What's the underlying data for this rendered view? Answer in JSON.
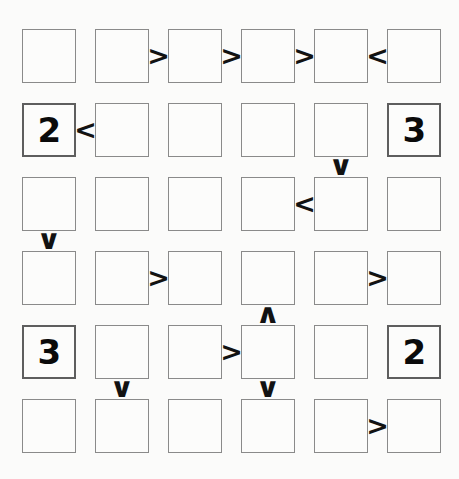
{
  "puzzle": {
    "type": "futoshiki",
    "size": 6,
    "rows": 6,
    "cols": 6,
    "background_color": "#fbfbfa",
    "cell_fill_color": "#fcfcfb",
    "cell_border_color": "#8a8a8a",
    "given_border_color": "#5e5e5e",
    "glyph_color": "#121212"
  },
  "cells": [
    [
      {
        "r": 1,
        "c": 1,
        "value": "",
        "given": false
      },
      {
        "r": 1,
        "c": 2,
        "value": "",
        "given": false
      },
      {
        "r": 1,
        "c": 3,
        "value": "",
        "given": false
      },
      {
        "r": 1,
        "c": 4,
        "value": "",
        "given": false
      },
      {
        "r": 1,
        "c": 5,
        "value": "",
        "given": false
      },
      {
        "r": 1,
        "c": 6,
        "value": "",
        "given": false
      }
    ],
    [
      {
        "r": 2,
        "c": 1,
        "value": "2",
        "given": true
      },
      {
        "r": 2,
        "c": 2,
        "value": "",
        "given": false
      },
      {
        "r": 2,
        "c": 3,
        "value": "",
        "given": false
      },
      {
        "r": 2,
        "c": 4,
        "value": "",
        "given": false
      },
      {
        "r": 2,
        "c": 5,
        "value": "",
        "given": false
      },
      {
        "r": 2,
        "c": 6,
        "value": "3",
        "given": true
      }
    ],
    [
      {
        "r": 3,
        "c": 1,
        "value": "",
        "given": false
      },
      {
        "r": 3,
        "c": 2,
        "value": "",
        "given": false
      },
      {
        "r": 3,
        "c": 3,
        "value": "",
        "given": false
      },
      {
        "r": 3,
        "c": 4,
        "value": "",
        "given": false
      },
      {
        "r": 3,
        "c": 5,
        "value": "",
        "given": false
      },
      {
        "r": 3,
        "c": 6,
        "value": "",
        "given": false
      }
    ],
    [
      {
        "r": 4,
        "c": 1,
        "value": "",
        "given": false
      },
      {
        "r": 4,
        "c": 2,
        "value": "",
        "given": false
      },
      {
        "r": 4,
        "c": 3,
        "value": "",
        "given": false
      },
      {
        "r": 4,
        "c": 4,
        "value": "",
        "given": false
      },
      {
        "r": 4,
        "c": 5,
        "value": "",
        "given": false
      },
      {
        "r": 4,
        "c": 6,
        "value": "",
        "given": false
      }
    ],
    [
      {
        "r": 5,
        "c": 1,
        "value": "3",
        "given": true
      },
      {
        "r": 5,
        "c": 2,
        "value": "",
        "given": false
      },
      {
        "r": 5,
        "c": 3,
        "value": "",
        "given": false
      },
      {
        "r": 5,
        "c": 4,
        "value": "",
        "given": false
      },
      {
        "r": 5,
        "c": 5,
        "value": "",
        "given": false
      },
      {
        "r": 5,
        "c": 6,
        "value": "2",
        "given": true
      }
    ],
    [
      {
        "r": 6,
        "c": 1,
        "value": "",
        "given": false
      },
      {
        "r": 6,
        "c": 2,
        "value": "",
        "given": false
      },
      {
        "r": 6,
        "c": 3,
        "value": "",
        "given": false
      },
      {
        "r": 6,
        "c": 4,
        "value": "",
        "given": false
      },
      {
        "r": 6,
        "c": 5,
        "value": "",
        "given": false
      },
      {
        "r": 6,
        "c": 6,
        "value": "",
        "given": false
      }
    ]
  ],
  "horizontal_constraints": [
    {
      "row": 1,
      "left_col": 2,
      "symbol": ">",
      "name": "greater-than"
    },
    {
      "row": 1,
      "left_col": 3,
      "symbol": ">",
      "name": "greater-than"
    },
    {
      "row": 1,
      "left_col": 4,
      "symbol": ">",
      "name": "greater-than"
    },
    {
      "row": 1,
      "left_col": 5,
      "symbol": "<",
      "name": "less-than"
    },
    {
      "row": 2,
      "left_col": 1,
      "symbol": "<",
      "name": "less-than"
    },
    {
      "row": 3,
      "left_col": 4,
      "symbol": "<",
      "name": "less-than"
    },
    {
      "row": 4,
      "left_col": 2,
      "symbol": ">",
      "name": "greater-than"
    },
    {
      "row": 4,
      "left_col": 5,
      "symbol": ">",
      "name": "greater-than"
    },
    {
      "row": 5,
      "left_col": 3,
      "symbol": ">",
      "name": "greater-than"
    },
    {
      "row": 6,
      "left_col": 5,
      "symbol": ">",
      "name": "greater-than"
    }
  ],
  "vertical_constraints": [
    {
      "col": 5,
      "top_row": 2,
      "symbol": "∨",
      "name": "greater-than-down"
    },
    {
      "col": 1,
      "top_row": 3,
      "symbol": "∨",
      "name": "greater-than-down"
    },
    {
      "col": 4,
      "top_row": 4,
      "symbol": "∧",
      "name": "less-than-up"
    },
    {
      "col": 2,
      "top_row": 5,
      "symbol": "∨",
      "name": "greater-than-down"
    },
    {
      "col": 4,
      "top_row": 5,
      "symbol": "∨",
      "name": "greater-than-down"
    }
  ]
}
